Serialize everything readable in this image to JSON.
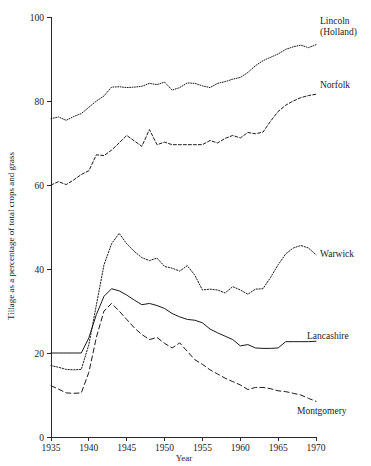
{
  "chart_data": {
    "type": "line",
    "title": "",
    "xlabel": "Year",
    "ylabel": "Tillage as a percentage of total crops and grass",
    "xlim": [
      1935,
      1970
    ],
    "ylim": [
      0,
      100
    ],
    "xticks": [
      1935,
      1940,
      1945,
      1950,
      1955,
      1960,
      1965,
      1970
    ],
    "yticks": [
      0,
      20,
      40,
      60,
      80,
      100
    ],
    "grid": false,
    "legend_position": "right-inline-labels",
    "x": [
      1935,
      1936,
      1937,
      1938,
      1939,
      1940,
      1941,
      1942,
      1943,
      1944,
      1945,
      1946,
      1947,
      1948,
      1949,
      1950,
      1951,
      1952,
      1953,
      1954,
      1955,
      1956,
      1957,
      1958,
      1959,
      1960,
      1961,
      1962,
      1963,
      1964,
      1965,
      1966,
      1967,
      1968,
      1969,
      1970
    ],
    "series": [
      {
        "name": "Lincoln (Holland)",
        "style": "fine-dotted",
        "label": "Lincoln\n(Holland)",
        "values": [
          75.8,
          76.2,
          75.4,
          76.3,
          77.0,
          78.5,
          80.0,
          81.2,
          83.3,
          83.4,
          83.2,
          83.3,
          83.5,
          84.2,
          83.9,
          84.5,
          82.6,
          83.2,
          84.3,
          84.2,
          83.6,
          83.2,
          84.2,
          84.6,
          85.2,
          85.6,
          86.8,
          88.4,
          89.6,
          90.4,
          91.2,
          92.3,
          92.9,
          93.3,
          92.7,
          93.4
        ]
      },
      {
        "name": "Norfolk",
        "style": "short-dashed",
        "label": "Norfolk",
        "values": [
          60.0,
          60.8,
          60.1,
          61.2,
          62.5,
          63.4,
          67.2,
          67.0,
          68.3,
          70.0,
          71.8,
          70.5,
          69.2,
          73.2,
          69.6,
          70.2,
          69.6,
          69.6,
          69.6,
          69.6,
          69.6,
          70.6,
          70.0,
          71.1,
          71.8,
          71.2,
          72.5,
          72.2,
          72.6,
          75.2,
          77.5,
          79.0,
          80.0,
          80.8,
          81.3,
          81.6
        ]
      },
      {
        "name": "Warwick",
        "style": "medium-dotted",
        "label": "Warwick",
        "values": [
          17.0,
          16.6,
          16.1,
          16.0,
          16.1,
          22.0,
          31.5,
          41.0,
          46.0,
          48.5,
          46.0,
          44.2,
          42.7,
          42.0,
          42.6,
          40.6,
          40.2,
          39.5,
          40.8,
          38.5,
          35.0,
          35.2,
          35.0,
          34.3,
          35.8,
          35.0,
          34.0,
          35.2,
          35.3,
          38.0,
          41.0,
          43.6,
          45.0,
          45.6,
          45.0,
          43.4
        ]
      },
      {
        "name": "Lancashire",
        "style": "solid",
        "label": "Lancashire",
        "values": [
          20.0,
          20.0,
          20.0,
          20.0,
          20.0,
          23.6,
          29.2,
          33.5,
          35.3,
          34.8,
          33.8,
          32.6,
          31.5,
          31.8,
          31.3,
          30.6,
          29.4,
          28.6,
          28.0,
          27.8,
          27.2,
          25.7,
          24.8,
          24.0,
          23.2,
          21.7,
          22.0,
          21.2,
          21.1,
          21.1,
          21.2,
          22.7,
          22.7,
          22.7,
          22.7,
          22.8
        ]
      },
      {
        "name": "Montgomery",
        "style": "long-dashed",
        "label": "Montgomery",
        "values": [
          12.2,
          11.4,
          10.5,
          10.4,
          10.5,
          15.4,
          23.8,
          30.0,
          31.8,
          30.0,
          28.0,
          26.0,
          24.4,
          23.2,
          23.7,
          22.3,
          21.2,
          22.4,
          20.4,
          18.4,
          17.3,
          16.0,
          15.0,
          14.0,
          13.2,
          12.4,
          11.3,
          11.8,
          11.8,
          11.5,
          11.0,
          10.8,
          10.4,
          10.0,
          9.2,
          8.5
        ]
      }
    ]
  },
  "axis": {
    "y_title": "Tillage as a percentage of total crops and grass",
    "x_title": "Year",
    "y_tick_labels": [
      "100",
      "80",
      "60",
      "40",
      "20",
      "0"
    ],
    "x_tick_labels": [
      "1935",
      "1940",
      "1945",
      "1950",
      "1955",
      "1960",
      "1965",
      "1970"
    ]
  },
  "labels": {
    "lincoln_line1": "Lincoln",
    "lincoln_line2": "(Holland)",
    "norfolk": "Norfolk",
    "warwick": "Warwick",
    "lancashire": "Lancashire",
    "montgomery": "Montgomery"
  }
}
